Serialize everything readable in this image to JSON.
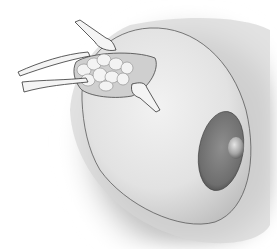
{
  "image": {
    "description": "Grayscale medical illustration of a breast surgical procedure with retractors exposing glandular tissue through an incision",
    "subjects": [
      "breast",
      "areola",
      "nipple",
      "incision",
      "retractors",
      "glandular-tissue"
    ],
    "palette": {
      "background": "#ffffff",
      "shadow": "#8a8a8a",
      "skin": "#e8e8e8",
      "skin_edge": "#5a5a5a",
      "areola": "#7e7e7e",
      "areola_dark": "#4a4a4a",
      "nipple": "#b5b5b5",
      "tissue": "#f0f0f0",
      "instrument": "#f4f4f4"
    }
  }
}
